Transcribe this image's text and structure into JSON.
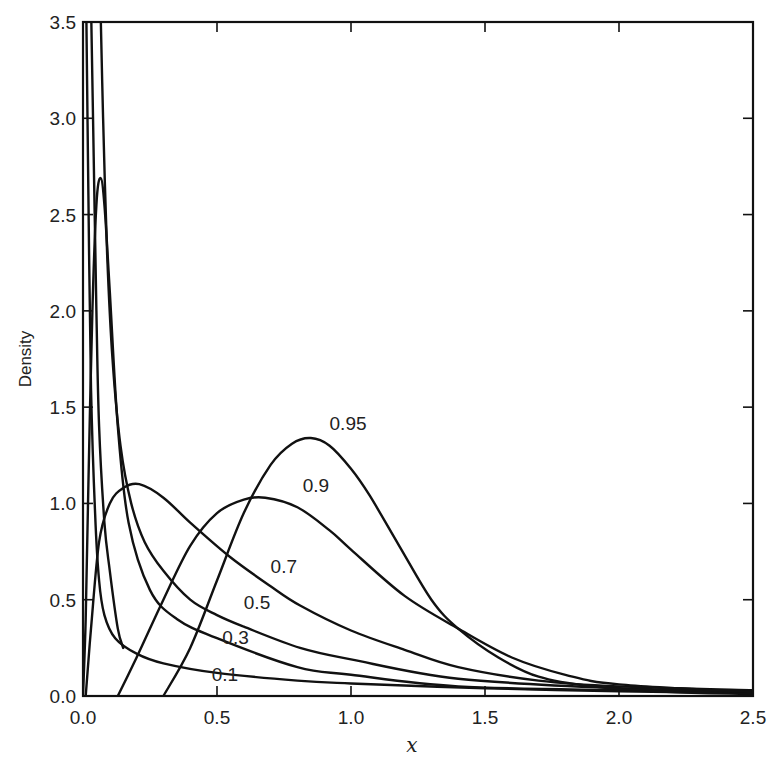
{
  "chart_data": {
    "type": "line",
    "title": "",
    "xlabel": "x",
    "ylabel": "Density",
    "xlim": [
      0.0,
      2.5
    ],
    "ylim": [
      0.0,
      3.5
    ],
    "x_ticks": [
      "0.0",
      "0.5",
      "1.0",
      "1.5",
      "2.0",
      "2.5"
    ],
    "y_ticks": [
      "0.0",
      "0.5",
      "1.0",
      "1.5",
      "2.0",
      "2.5",
      "3.0",
      "3.5"
    ],
    "grid": false,
    "legend": "inline curve labels",
    "series": [
      {
        "name": "0.1",
        "label_pos": [
          0.48,
          0.08
        ],
        "points": [
          [
            0.012,
            3.6
          ],
          [
            0.02,
            2.6
          ],
          [
            0.03,
            1.6
          ],
          [
            0.045,
            0.95
          ],
          [
            0.06,
            0.6
          ],
          [
            0.08,
            0.42
          ],
          [
            0.12,
            0.3
          ],
          [
            0.2,
            0.22
          ],
          [
            0.3,
            0.17
          ],
          [
            0.5,
            0.12
          ],
          [
            0.8,
            0.08
          ],
          [
            1.0,
            0.065
          ],
          [
            1.5,
            0.04
          ],
          [
            2.0,
            0.025
          ],
          [
            2.5,
            0.015
          ]
        ]
      },
      {
        "name": "0.3",
        "label_pos": [
          0.52,
          0.27
        ],
        "points": [
          [
            0.0,
            0.0
          ],
          [
            0.01,
            0.4
          ],
          [
            0.02,
            1.1
          ],
          [
            0.035,
            2.0
          ],
          [
            0.05,
            2.55
          ],
          [
            0.065,
            2.69
          ],
          [
            0.08,
            2.55
          ],
          [
            0.1,
            2.1
          ],
          [
            0.13,
            1.4
          ],
          [
            0.17,
            0.9
          ],
          [
            0.25,
            0.55
          ],
          [
            0.35,
            0.4
          ],
          [
            0.5,
            0.3
          ],
          [
            0.8,
            0.15
          ],
          [
            1.0,
            0.11
          ],
          [
            1.4,
            0.05
          ],
          [
            2.0,
            0.03
          ],
          [
            2.5,
            0.02
          ]
        ]
      },
      {
        "name": "0.5",
        "label_pos": [
          0.6,
          0.45
        ],
        "points": [
          [
            0.065,
            3.6
          ],
          [
            0.075,
            3.0
          ],
          [
            0.09,
            2.3
          ],
          [
            0.11,
            1.75
          ],
          [
            0.14,
            1.3
          ],
          [
            0.18,
            1.0
          ],
          [
            0.23,
            0.8
          ],
          [
            0.3,
            0.65
          ],
          [
            0.4,
            0.5
          ],
          [
            0.5,
            0.42
          ],
          [
            0.6,
            0.36
          ],
          [
            0.81,
            0.25
          ],
          [
            1.0,
            0.19
          ],
          [
            1.4,
            0.09
          ],
          [
            2.0,
            0.04
          ],
          [
            2.5,
            0.025
          ]
        ]
      },
      {
        "name": "0.7",
        "label_pos": [
          0.7,
          0.64
        ],
        "points": [
          [
            0.03,
            3.6
          ],
          [
            0.04,
            2.8
          ],
          [
            0.05,
            2.0
          ],
          [
            0.06,
            1.4
          ],
          [
            0.08,
            0.9
          ],
          [
            0.1,
            0.65
          ],
          [
            0.13,
            0.35
          ],
          [
            0.15,
            0.25
          ]
        ]
      },
      {
        "name": "0.7-body",
        "hidden_label": true,
        "points": [
          [
            0.01,
            0.0
          ],
          [
            0.03,
            0.35
          ],
          [
            0.06,
            0.8
          ],
          [
            0.1,
            1.0
          ],
          [
            0.15,
            1.08
          ],
          [
            0.21,
            1.1
          ],
          [
            0.3,
            1.03
          ],
          [
            0.4,
            0.9
          ],
          [
            0.55,
            0.72
          ],
          [
            0.7,
            0.57
          ],
          [
            0.81,
            0.47
          ],
          [
            1.0,
            0.34
          ],
          [
            1.2,
            0.24
          ],
          [
            1.4,
            0.15
          ],
          [
            1.7,
            0.08
          ],
          [
            2.0,
            0.05
          ],
          [
            2.5,
            0.03
          ]
        ]
      },
      {
        "name": "0.9",
        "label_pos": [
          0.82,
          1.06
        ],
        "points": [
          [
            0.13,
            0.0
          ],
          [
            0.2,
            0.2
          ],
          [
            0.3,
            0.5
          ],
          [
            0.4,
            0.78
          ],
          [
            0.5,
            0.95
          ],
          [
            0.6,
            1.02
          ],
          [
            0.68,
            1.03
          ],
          [
            0.8,
            0.98
          ],
          [
            0.92,
            0.86
          ],
          [
            1.0,
            0.76
          ],
          [
            1.2,
            0.52
          ],
          [
            1.4,
            0.35
          ],
          [
            1.6,
            0.2
          ],
          [
            1.8,
            0.11
          ],
          [
            2.0,
            0.06
          ],
          [
            2.5,
            0.02
          ]
        ]
      },
      {
        "name": "0.95",
        "label_pos": [
          0.92,
          1.38
        ],
        "points": [
          [
            0.3,
            0.0
          ],
          [
            0.4,
            0.25
          ],
          [
            0.5,
            0.6
          ],
          [
            0.6,
            0.95
          ],
          [
            0.7,
            1.2
          ],
          [
            0.78,
            1.31
          ],
          [
            0.85,
            1.34
          ],
          [
            0.92,
            1.3
          ],
          [
            1.0,
            1.18
          ],
          [
            1.07,
            1.04
          ],
          [
            1.18,
            0.78
          ],
          [
            1.3,
            0.5
          ],
          [
            1.4,
            0.35
          ],
          [
            1.55,
            0.2
          ],
          [
            1.7,
            0.1
          ],
          [
            1.9,
            0.05
          ],
          [
            2.2,
            0.02
          ],
          [
            2.5,
            0.01
          ]
        ]
      }
    ]
  },
  "axes": {
    "ylabel": "Density",
    "xlabel": "x"
  }
}
